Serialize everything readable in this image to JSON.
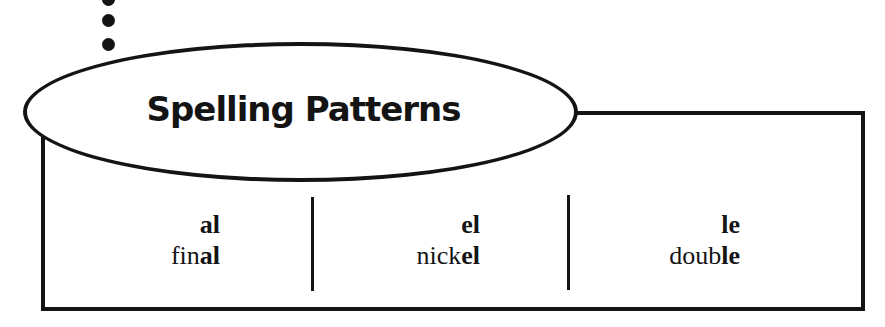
{
  "title": "Spelling Patterns",
  "columns": [
    {
      "pattern": "al",
      "example": {
        "prefix": "fin",
        "suffix": "al"
      }
    },
    {
      "pattern": "el",
      "example": {
        "prefix": "nick",
        "suffix": "el"
      }
    },
    {
      "pattern": "le",
      "example": {
        "prefix": "doub",
        "suffix": "le"
      }
    }
  ],
  "colors": {
    "ink": "#141414",
    "background": "#ffffff"
  }
}
